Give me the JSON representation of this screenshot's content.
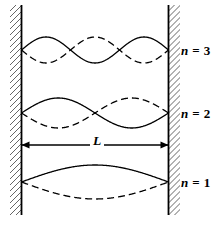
{
  "figure": {
    "colors": {
      "line": "#000000",
      "background": "#ffffff",
      "hatch": "#555555"
    },
    "walls": {
      "left_x": 21.5,
      "right_x": 168.5,
      "top_y": 5,
      "bottom_y": 215,
      "hatch_side_left": "outside-left",
      "hatch_side_right": "outside-right",
      "hatch_spacing": 6,
      "hatch_width": 11
    },
    "dimension": {
      "label": "L",
      "label_x": 95,
      "label_y": 143,
      "line_y": 145,
      "x_start": 21.5,
      "x_end": 168.5,
      "arrowheads": "both"
    },
    "modes": [
      {
        "n": 1,
        "label_prefix": "n",
        "label_eq": "=",
        "label_value": "1",
        "label_text": "n = 1",
        "label_x": 181,
        "label_y": 175,
        "center_y": 182,
        "amplitude": 17,
        "half_wavelengths": 1,
        "solid_phase": "up",
        "node_count_interior": 0
      },
      {
        "n": 2,
        "label_prefix": "n",
        "label_eq": "=",
        "label_value": "2",
        "label_text": "n = 2",
        "label_x": 181,
        "label_y": 106,
        "center_y": 113,
        "amplitude": 15,
        "half_wavelengths": 2,
        "solid_phase": "up",
        "node_count_interior": 1
      },
      {
        "n": 3,
        "label_prefix": "n",
        "label_eq": "=",
        "label_value": "3",
        "label_text": "n = 3",
        "label_x": 181,
        "label_y": 43,
        "center_y": 50,
        "amplitude": 13,
        "half_wavelengths": 3,
        "solid_phase": "up",
        "node_count_interior": 2
      }
    ],
    "curve_styles": {
      "solid": {
        "dash": "none",
        "width": 1.3
      },
      "dashed": {
        "dash": "7,4",
        "width": 1.3
      }
    }
  }
}
